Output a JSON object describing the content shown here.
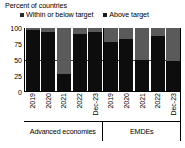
{
  "chart_data": {
    "type": "bar",
    "title": "Percent of countries",
    "subtitle": "",
    "xlabel": "",
    "ylabel": "",
    "ylim": [
      0,
      100
    ],
    "yticks": [
      0,
      25,
      50,
      75,
      100
    ],
    "grid": false,
    "stacked": true,
    "legend_position": "top",
    "reference_line": 50,
    "groups": [
      {
        "name": "Advanced economies",
        "categories": [
          "2019",
          "2020",
          "2021",
          "2022",
          "Dec-23"
        ]
      },
      {
        "name": "EMDEs",
        "categories": [
          "2019",
          "2020",
          "2021",
          "2022",
          "Dec-23"
        ]
      }
    ],
    "categories": [
      "2019",
      "2020",
      "2021",
      "2022",
      "Dec-23",
      "2019",
      "2020",
      "2021",
      "2022",
      "Dec-23"
    ],
    "series": [
      {
        "name": "Within or below target",
        "color": "#0d0d0d",
        "values": [
          97,
          94,
          27,
          91,
          94,
          78,
          82,
          50,
          88,
          47
        ]
      },
      {
        "name": "Above target",
        "color": "#5a5a5a",
        "values": [
          3,
          6,
          73,
          9,
          6,
          22,
          18,
          50,
          12,
          53
        ]
      }
    ]
  },
  "legend": {
    "items": [
      {
        "label": "Within or below target",
        "swatch": "within"
      },
      {
        "label": "Above target",
        "swatch": "above"
      }
    ]
  },
  "colors": {
    "within_target": "#0d0d0d",
    "above_target": "#5a5a5a",
    "axis": "#000000",
    "reference_line": "#3c3c3c",
    "background": "#ffffff"
  }
}
